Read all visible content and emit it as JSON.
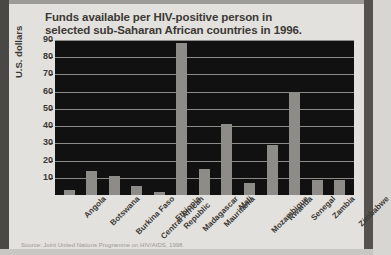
{
  "figure": {
    "title_line1": "Funds available per HIV-positive person in",
    "title_line2": "selected sub-Saharan African countries in 1996.",
    "source_note": "Source: Joint United Nations Programme on HIV/AIDS, 1998."
  },
  "colors": {
    "background": "#e3e1dd",
    "plot_background": "#111111",
    "bar": "#8e8c88",
    "gridline": "#8d8b87",
    "text": "#3b3936",
    "frame": "#4a4845"
  },
  "chart_data": {
    "type": "bar",
    "title": "Funds available per HIV-positive person in selected sub-Saharan African countries in 1996.",
    "xlabel": "",
    "ylabel": "U.S. dollars",
    "ylim": [
      0,
      90
    ],
    "yticks": [
      90,
      80,
      70,
      60,
      50,
      40,
      30,
      20,
      10
    ],
    "grid": true,
    "legend": "none",
    "units": "U.S. dollars",
    "categories": [
      "Angola",
      "Botswana",
      "Burkina Faso",
      "Central African Republic",
      "Ethiopia",
      "Madagascar",
      "Mauritania",
      "Mali",
      "Mozambique",
      "Rwanda",
      "Senegal",
      "Zambia",
      "Zimbabwe"
    ],
    "values": [
      3,
      14,
      11,
      5,
      2,
      88,
      15,
      41,
      7,
      29,
      60,
      9,
      9
    ]
  }
}
